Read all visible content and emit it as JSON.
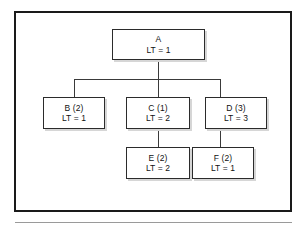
{
  "figure": {
    "type": "hierarchy-tree-diagram",
    "frame_color": "#1a1a1a",
    "node_border_color": "#2b2b2b",
    "connector_color": "#3a3a3a",
    "background": "#ffffff"
  },
  "nodes": {
    "a": {
      "name": "A",
      "lead_time": "LT = 1"
    },
    "b": {
      "name": "B (2)",
      "lead_time": "LT = 1"
    },
    "c": {
      "name": "C (1)",
      "lead_time": "LT = 2"
    },
    "d": {
      "name": "D (3)",
      "lead_time": "LT = 3"
    },
    "e": {
      "name": "E (2)",
      "lead_time": "LT = 2"
    },
    "f": {
      "name": "F (2)",
      "lead_time": "LT = 1"
    }
  },
  "tree": {
    "root": "A",
    "edges": [
      {
        "from": "A",
        "to": "B"
      },
      {
        "from": "A",
        "to": "C"
      },
      {
        "from": "A",
        "to": "D"
      },
      {
        "from": "C",
        "to": "E"
      },
      {
        "from": "D",
        "to": "F"
      }
    ]
  }
}
